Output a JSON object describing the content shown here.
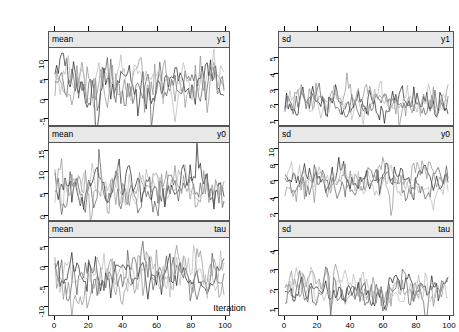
{
  "figure": {
    "xlabel": "Iteration",
    "background": "#ffffff",
    "strip_background": "#e8e8e8",
    "border_color": "#555555"
  },
  "chart_data": {
    "type": "line",
    "title": "",
    "xlabel": "Iteration",
    "ylabel": "",
    "grid": false,
    "legend": "none",
    "xlim": [
      0,
      100
    ],
    "xticks": [
      0,
      20,
      40,
      60,
      80,
      100
    ],
    "n_chains": 4,
    "chain_colors": [
      "#1a1a1a",
      "#555555",
      "#8c8c8c",
      "#b5b5b5"
    ],
    "panels": [
      {
        "id": "mean-y1",
        "row": 0,
        "col": 0,
        "strip_left": "mean",
        "strip_right": "y1",
        "ylim": [
          -7,
          13
        ],
        "yticks": [
          -5,
          0,
          5,
          10
        ],
        "ytick_labels": [
          "-5",
          "0",
          "5",
          "10"
        ],
        "series_stats": [
          {
            "mean": 4.5,
            "sd": 3.2
          },
          {
            "mean": 4.0,
            "sd": 3.4
          },
          {
            "mean": 3.6,
            "sd": 3.6
          },
          {
            "mean": 4.2,
            "sd": 3.0
          }
        ]
      },
      {
        "id": "sd-y1",
        "row": 0,
        "col": 1,
        "strip_left": "sd",
        "strip_right": "y1",
        "ylim": [
          0.6,
          5.6
        ],
        "yticks": [
          1,
          2,
          3,
          4,
          5
        ],
        "ytick_labels": [
          "1",
          "2",
          "3",
          "4",
          "5"
        ],
        "series_stats": [
          {
            "mean": 2.1,
            "sd": 0.55
          },
          {
            "mean": 2.0,
            "sd": 0.5
          },
          {
            "mean": 2.15,
            "sd": 0.6
          },
          {
            "mean": 2.05,
            "sd": 0.52
          }
        ]
      },
      {
        "id": "mean-y0",
        "row": 1,
        "col": 0,
        "strip_left": "mean",
        "strip_right": "y0",
        "ylim": [
          -1.5,
          16.5
        ],
        "yticks": [
          0,
          5,
          10,
          15
        ],
        "ytick_labels": [
          "0",
          "5",
          "10",
          "15"
        ],
        "series_stats": [
          {
            "mean": 7.0,
            "sd": 2.8
          },
          {
            "mean": 6.2,
            "sd": 2.9
          },
          {
            "mean": 5.6,
            "sd": 3.0
          },
          {
            "mean": 6.6,
            "sd": 2.6
          }
        ]
      },
      {
        "id": "sd-y0",
        "row": 1,
        "col": 1,
        "strip_left": "sd",
        "strip_right": "y0",
        "ylim": [
          1.0,
          10.6
        ],
        "yticks": [
          2,
          4,
          6,
          8,
          10
        ],
        "ytick_labels": [
          "2",
          "4",
          "6",
          "8",
          "10"
        ],
        "series_stats": [
          {
            "mean": 5.6,
            "sd": 1.15
          },
          {
            "mean": 5.4,
            "sd": 1.1
          },
          {
            "mean": 5.7,
            "sd": 1.2
          },
          {
            "mean": 5.5,
            "sd": 1.05
          }
        ]
      },
      {
        "id": "mean-tau",
        "row": 2,
        "col": 0,
        "strip_left": "mean",
        "strip_right": "tau",
        "ylim": [
          -12.5,
          7
        ],
        "yticks": [
          -10,
          -5,
          0,
          5
        ],
        "ytick_labels": [
          "-10",
          "-5",
          "0",
          "5"
        ],
        "series_stats": [
          {
            "mean": -2.4,
            "sd": 2.9
          },
          {
            "mean": -2.0,
            "sd": 3.1
          },
          {
            "mean": -3.2,
            "sd": 3.3
          },
          {
            "mean": -2.1,
            "sd": 2.8
          }
        ]
      },
      {
        "id": "sd-tau",
        "row": 2,
        "col": 1,
        "strip_left": "sd",
        "strip_right": "tau",
        "ylim": [
          0.6,
          4.6
        ],
        "yticks": [
          1,
          2,
          3,
          4
        ],
        "ytick_labels": [
          "1",
          "2",
          "3",
          "4"
        ],
        "series_stats": [
          {
            "mean": 1.95,
            "sd": 0.45
          },
          {
            "mean": 1.85,
            "sd": 0.42
          },
          {
            "mean": 2.0,
            "sd": 0.5
          },
          {
            "mean": 1.9,
            "sd": 0.44
          }
        ]
      }
    ]
  }
}
